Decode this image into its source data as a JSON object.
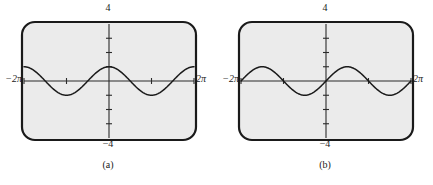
{
  "figure": {
    "background_color": "#ffffff",
    "panels": [
      {
        "id": "a",
        "caption": "(a)",
        "labels": {
          "top": "4",
          "bottom": "−4",
          "left": "−2π",
          "right": "2π"
        },
        "screen": {
          "background_color": "#ebebeb",
          "border_color": "#1a1a1a"
        }
      },
      {
        "id": "b",
        "caption": "(b)",
        "labels": {
          "top": "4",
          "bottom": "−4",
          "left": "−2π",
          "right": "2π"
        },
        "screen": {
          "background_color": "#ebebeb",
          "border_color": "#1a1a1a"
        }
      }
    ]
  },
  "chart_data": [
    {
      "type": "line",
      "panel": "a",
      "title": "",
      "subtitle": "",
      "xlabel": "",
      "ylabel": "",
      "xlim": [
        -6.283185,
        6.283185
      ],
      "ylim": [
        -4,
        4
      ],
      "xtick_labels": [
        "−2π",
        "2π"
      ],
      "ytick_labels": [
        "4",
        "−4"
      ],
      "xticks": [
        -3.141593,
        3.141593
      ],
      "yticks": [
        -3,
        -2,
        -1,
        1,
        2,
        3
      ],
      "grid": false,
      "legend": null,
      "annotations": [
        "(a)"
      ],
      "series": [
        {
          "name": "y = cos x",
          "function": "cos",
          "amplitude": 1,
          "period": 6.283185,
          "phase": 0,
          "vertical_shift": 0,
          "color": "#1a1a1a",
          "x": [
            -6.283185,
            -5.890486,
            -5.497787,
            -5.105088,
            -4.712389,
            -4.31969,
            -3.926991,
            -3.534292,
            -3.141593,
            -2.748894,
            -2.356194,
            -1.963495,
            -1.570796,
            -1.178097,
            -0.785398,
            -0.392699,
            0.0,
            0.392699,
            0.785398,
            1.178097,
            1.570796,
            1.963495,
            2.356194,
            2.748894,
            3.141593,
            3.534292,
            3.926991,
            4.31969,
            4.712389,
            5.105088,
            5.497787,
            5.890486,
            6.283185
          ],
          "y": [
            1.0,
            0.924,
            0.707,
            0.383,
            0.0,
            -0.383,
            -0.707,
            -0.924,
            -1.0,
            -0.924,
            -0.707,
            -0.383,
            0.0,
            0.383,
            0.707,
            0.924,
            1.0,
            0.924,
            0.707,
            0.383,
            0.0,
            -0.383,
            -0.707,
            -0.924,
            -1.0,
            -0.924,
            -0.707,
            -0.383,
            0.0,
            0.383,
            0.707,
            0.924,
            1.0
          ]
        }
      ]
    },
    {
      "type": "line",
      "panel": "b",
      "title": "",
      "subtitle": "",
      "xlabel": "",
      "ylabel": "",
      "xlim": [
        -6.283185,
        6.283185
      ],
      "ylim": [
        -4,
        4
      ],
      "xtick_labels": [
        "−2π",
        "2π"
      ],
      "ytick_labels": [
        "4",
        "−4"
      ],
      "xticks": [
        -3.141593,
        3.141593
      ],
      "yticks": [
        -3,
        -2,
        -1,
        1,
        2,
        3
      ],
      "grid": false,
      "legend": null,
      "annotations": [
        "(b)"
      ],
      "series": [
        {
          "name": "y = sin x",
          "function": "sin",
          "amplitude": 1,
          "period": 6.283185,
          "phase": 0,
          "vertical_shift": 0,
          "color": "#1a1a1a",
          "x": [
            -6.283185,
            -5.890486,
            -5.497787,
            -5.105088,
            -4.712389,
            -4.31969,
            -3.926991,
            -3.534292,
            -3.141593,
            -2.748894,
            -2.356194,
            -1.963495,
            -1.570796,
            -1.178097,
            -0.785398,
            -0.392699,
            0.0,
            0.392699,
            0.785398,
            1.178097,
            1.570796,
            1.963495,
            2.356194,
            2.748894,
            3.141593,
            3.534292,
            3.926991,
            4.31969,
            4.712389,
            5.105088,
            5.497787,
            5.890486,
            6.283185
          ],
          "y": [
            0.0,
            0.383,
            0.707,
            0.924,
            1.0,
            0.924,
            0.707,
            0.383,
            0.0,
            -0.383,
            -0.707,
            -0.924,
            -1.0,
            -0.924,
            -0.707,
            -0.383,
            0.0,
            0.383,
            0.707,
            0.924,
            1.0,
            0.924,
            0.707,
            0.383,
            0.0,
            -0.383,
            -0.707,
            -0.924,
            -1.0,
            -0.924,
            -0.707,
            -0.383,
            0.0
          ]
        }
      ]
    }
  ]
}
